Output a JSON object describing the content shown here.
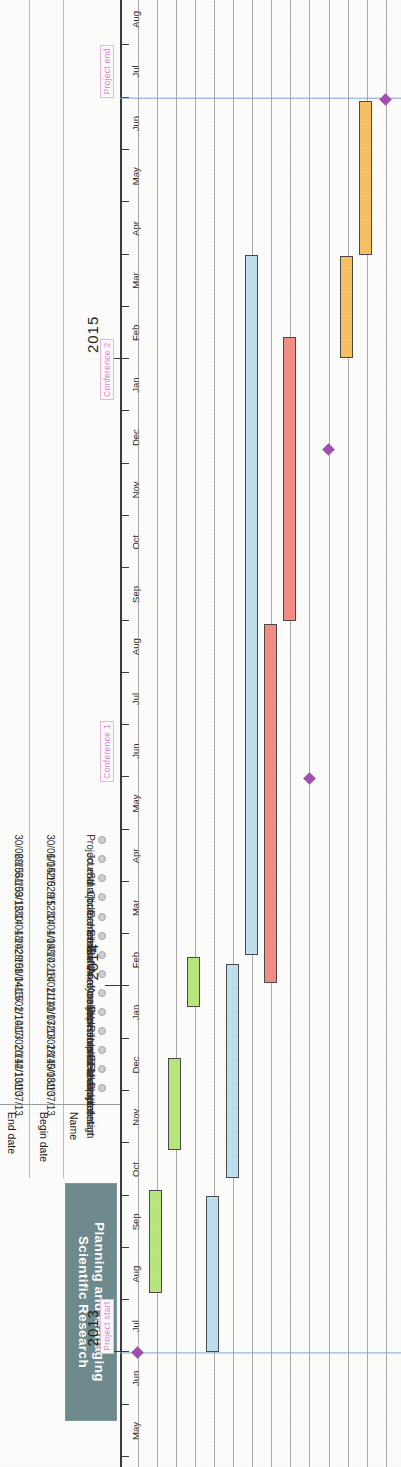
{
  "header": {
    "title_line1": "Planning and Managing",
    "title_line2": "Scientific Research",
    "title_bg": "#6f8b8d",
    "title_color": "#ffffff"
  },
  "table": {
    "columns": [
      "Name",
      "Begin date",
      "End date"
    ],
    "rows": [
      {
        "name": "Project start",
        "begin": "1/07/13",
        "end": "1/07/13"
      },
      {
        "name": "Fieldwork design",
        "begin": "5/08/13",
        "end": "4/10/13"
      },
      {
        "name": "In Field",
        "begin": "28/10/13",
        "end": "20/12/13"
      },
      {
        "name": "Return field samples",
        "begin": "20/01/14",
        "end": "17/02/14"
      },
      {
        "name": "Experimental development",
        "begin": "1/07/13",
        "end": "1/10/13"
      },
      {
        "name": "Analyse reference samples",
        "begin": "11/10/13",
        "end": "13/02/14"
      },
      {
        "name": "Analyse field samples",
        "begin": "18/02/14",
        "end": "1/04/15"
      },
      {
        "name": "Software creation",
        "begin": "3/02/14",
        "end": "29/08/14"
      },
      {
        "name": "Simulation of results",
        "begin": "1/09/14",
        "end": "13/02/15"
      },
      {
        "name": "Conference 1",
        "begin": "30/04/14",
        "end": "30/04/14"
      },
      {
        "name": "Conference 2",
        "begin": "9/12/14",
        "end": "9/12/14"
      },
      {
        "name": "Start journal article",
        "begin": "2/02/15",
        "end": "31/03/15"
      },
      {
        "name": "Journal article",
        "begin": "1/04/15",
        "end": "29/06/15"
      },
      {
        "name": "Project end",
        "begin": "30/06/15",
        "end": "30/06/15"
      }
    ]
  },
  "timeline": {
    "years": [
      {
        "label": "2013",
        "month_index": 2
      },
      {
        "label": "2014",
        "month_index": 9
      },
      {
        "label": "2015",
        "month_index": 21
      }
    ],
    "months": [
      "May",
      "Jun",
      "Jul",
      "Aug",
      "Sep",
      "Oct",
      "Nov",
      "Dec",
      "Jan",
      "Feb",
      "Mar",
      "Apr",
      "May",
      "Jun",
      "Jul",
      "Aug",
      "Sep",
      "Oct",
      "Nov",
      "Dec",
      "Jan",
      "Feb",
      "Mar",
      "Apr",
      "May",
      "Jun",
      "Jul",
      "Aug"
    ],
    "start_label": "May 2013",
    "end_label": "Aug 2015"
  },
  "annotations": [
    {
      "label": "Project start",
      "month_index": 2.0
    },
    {
      "label": "Conference 1",
      "month_index": 13.0
    },
    {
      "label": "Conference 2",
      "month_index": 20.3
    },
    {
      "label": "Project end",
      "month_index": 26.0
    }
  ],
  "chart_data": {
    "type": "bar",
    "title": "Planning and Managing Scientific Research",
    "xlabel": "",
    "ylabel": "",
    "axis_start": "May 2013",
    "axis_end": "Aug 2015",
    "grid": true,
    "legend": "none",
    "colors": {
      "green": "#b9e77f",
      "blue": "#bfe0f0",
      "red": "#f58d84",
      "orange": "#f9c163",
      "milestone": "#a24fb0",
      "guide_line": "#7fa8d8"
    },
    "categories": [
      "Project start",
      "Fieldwork design",
      "In Field",
      "Return field samples",
      "Experimental development",
      "Analyse reference samples",
      "Analyse field samples",
      "Software creation",
      "Simulation of results",
      "Conference 1",
      "Conference 2",
      "Start journal article",
      "Journal article",
      "Project end"
    ],
    "tasks": [
      {
        "name": "Project start",
        "row": 0,
        "begin": "1/07/13",
        "end": "1/07/13",
        "start_m": 2.0,
        "end_m": 2.0,
        "kind": "milestone",
        "color": "#a24fb0"
      },
      {
        "name": "Fieldwork design",
        "row": 1,
        "begin": "5/08/13",
        "end": "4/10/13",
        "start_m": 3.13,
        "end_m": 5.1,
        "kind": "bar",
        "color": "#b9e77f"
      },
      {
        "name": "In Field",
        "row": 2,
        "begin": "28/10/13",
        "end": "20/12/13",
        "start_m": 5.87,
        "end_m": 7.63,
        "kind": "bar",
        "color": "#b9e77f"
      },
      {
        "name": "Return field samples",
        "row": 3,
        "begin": "20/01/14",
        "end": "17/02/14",
        "start_m": 8.61,
        "end_m": 9.57,
        "kind": "bar",
        "color": "#b9e77f"
      },
      {
        "name": "Experimental development",
        "row": 4,
        "begin": "1/07/13",
        "end": "1/10/13",
        "start_m": 2.0,
        "end_m": 5.0,
        "kind": "bar",
        "color": "#bfe0f0"
      },
      {
        "name": "Analyse reference samples",
        "row": 5,
        "begin": "11/10/13",
        "end": "13/02/14",
        "start_m": 5.33,
        "end_m": 9.43,
        "kind": "bar",
        "color": "#bfe0f0"
      },
      {
        "name": "Analyse field samples",
        "row": 6,
        "begin": "18/02/14",
        "end": "1/04/15",
        "start_m": 9.6,
        "end_m": 23.0,
        "kind": "bar",
        "color": "#bfe0f0"
      },
      {
        "name": "Software creation",
        "row": 7,
        "begin": "3/02/14",
        "end": "29/08/14",
        "start_m": 9.07,
        "end_m": 15.93,
        "kind": "bar",
        "color": "#f58d84"
      },
      {
        "name": "Simulation of results",
        "row": 8,
        "begin": "1/09/14",
        "end": "13/02/15",
        "start_m": 16.0,
        "end_m": 21.43,
        "kind": "bar",
        "color": "#f58d84"
      },
      {
        "name": "Conference 1",
        "row": 9,
        "begin": "30/04/14",
        "end": "30/04/14",
        "start_m": 12.97,
        "end_m": 12.97,
        "kind": "milestone",
        "color": "#a24fb0"
      },
      {
        "name": "Conference 2",
        "row": 10,
        "begin": "9/12/14",
        "end": "9/12/14",
        "start_m": 19.27,
        "end_m": 19.27,
        "kind": "milestone",
        "color": "#a24fb0"
      },
      {
        "name": "Start journal article",
        "row": 11,
        "begin": "2/02/15",
        "end": "31/03/15",
        "start_m": 21.03,
        "end_m": 22.97,
        "kind": "bar",
        "color": "#f9c163"
      },
      {
        "name": "Journal article",
        "row": 12,
        "begin": "1/04/15",
        "end": "29/06/15",
        "start_m": 23.0,
        "end_m": 25.93,
        "kind": "bar",
        "color": "#f9c163"
      },
      {
        "name": "Project end",
        "row": 13,
        "begin": "30/06/15",
        "end": "30/06/15",
        "start_m": 25.97,
        "end_m": 25.97,
        "kind": "milestone",
        "color": "#a24fb0"
      }
    ],
    "guide_lines_month": [
      2.0,
      26.0
    ]
  }
}
